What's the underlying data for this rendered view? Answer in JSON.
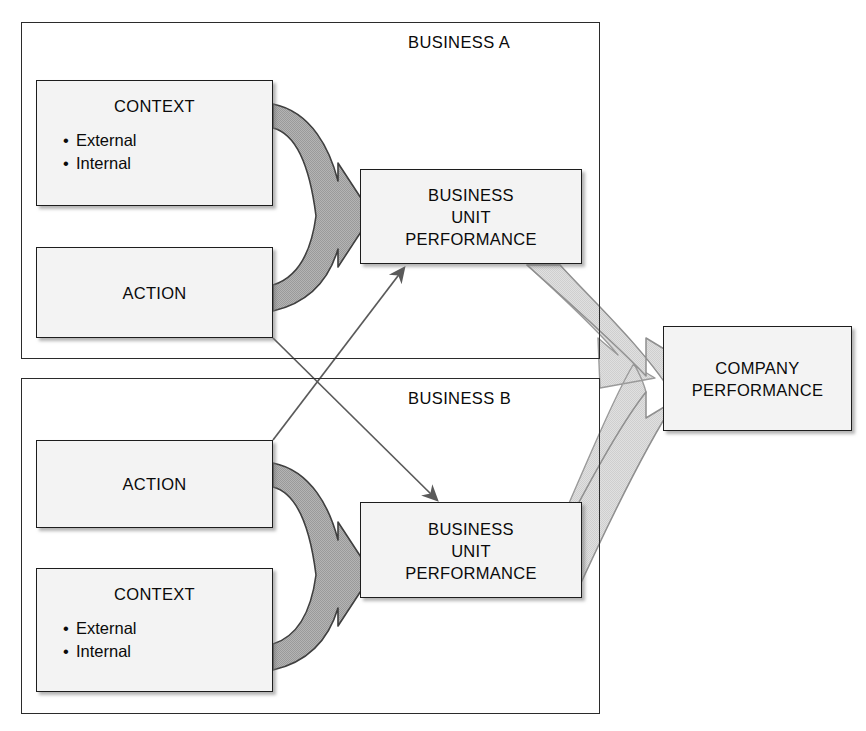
{
  "diagram": {
    "colors": {
      "box_fill": "#f3f3f3",
      "box_border": "#1d1d1d",
      "frame_border": "#2b2b2b",
      "arrow_dark_gray": "#a9a9a9",
      "arrow_light_gray": "#d9d9d9",
      "arrow_outline": "#3a3a3a",
      "connector_line": "#5a5a5a",
      "text": "#0a0a0a"
    },
    "frames": [
      {
        "id": "a",
        "label": "BUSINESS A"
      },
      {
        "id": "b",
        "label": "BUSINESS B"
      }
    ],
    "business_a": {
      "context": {
        "title": "CONTEXT",
        "bullets": [
          "External",
          "Internal"
        ]
      },
      "action": {
        "title": "ACTION"
      },
      "performance": {
        "line1": "BUSINESS",
        "line2": "UNIT",
        "line3": "PERFORMANCE"
      }
    },
    "business_b": {
      "action": {
        "title": "ACTION"
      },
      "context": {
        "title": "CONTEXT",
        "bullets": [
          "External",
          "Internal"
        ]
      },
      "performance": {
        "line1": "BUSINESS",
        "line2": "UNIT",
        "line3": "PERFORMANCE"
      }
    },
    "company": {
      "line1": "COMPANY",
      "line2": "PERFORMANCE"
    },
    "connectors": [
      {
        "name": "action-a-to-performance-b",
        "from": "ACTION (Business A)",
        "to": "BUSINESS UNIT PERFORMANCE (Business B)",
        "style": "thin-line-arrow"
      },
      {
        "name": "action-b-to-performance-a",
        "from": "ACTION (Business B)",
        "to": "BUSINESS UNIT PERFORMANCE (Business A)",
        "style": "thin-line-arrow"
      },
      {
        "name": "context-action-a-merge-arrow",
        "from": "CONTEXT + ACTION (Business A)",
        "to": "BUSINESS UNIT PERFORMANCE (Business A)",
        "style": "thick-gray-merge-arrow"
      },
      {
        "name": "context-action-b-merge-arrow",
        "from": "ACTION + CONTEXT (Business B)",
        "to": "BUSINESS UNIT PERFORMANCE (Business B)",
        "style": "thick-gray-merge-arrow"
      },
      {
        "name": "performance-units-merge-to-company",
        "from": "BUSINESS UNIT PERFORMANCE (A and B)",
        "to": "COMPANY PERFORMANCE",
        "style": "thick-light-gray-merge-arrow"
      }
    ]
  }
}
